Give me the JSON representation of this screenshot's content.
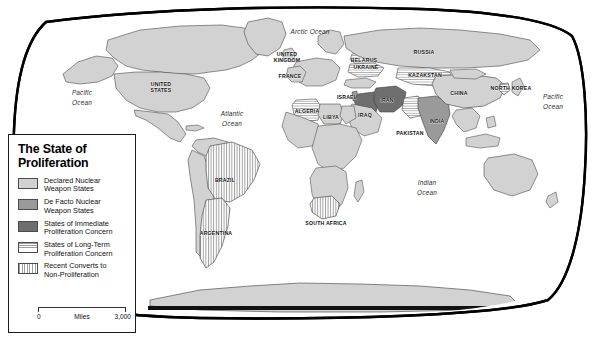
{
  "map": {
    "title": "The State of Proliferation",
    "projection": "robinson",
    "frame_color": "#000000",
    "background_color": "#ffffff",
    "ocean_labels": [
      {
        "name": "pacific-ocean-west",
        "lines": [
          "Pacific",
          "Ocean"
        ],
        "x": 82,
        "y": 97
      },
      {
        "name": "atlantic-ocean",
        "lines": [
          "Atlantic",
          "Ocean"
        ],
        "x": 232,
        "y": 118
      },
      {
        "name": "arctic-ocean",
        "lines": [
          "Arctic Ocean"
        ],
        "x": 310,
        "y": 32
      },
      {
        "name": "indian-ocean",
        "lines": [
          "Indian",
          "Ocean"
        ],
        "x": 427,
        "y": 187
      },
      {
        "name": "pacific-ocean-east",
        "lines": [
          "Pacific",
          "Ocean"
        ],
        "x": 553,
        "y": 101
      }
    ],
    "country_labels": [
      {
        "name": "united-states",
        "lines": [
          "UNITED",
          "STATES"
        ],
        "x": 161,
        "y": 87
      },
      {
        "name": "united-kingdom",
        "lines": [
          "UNITED",
          "KINGDOM"
        ],
        "x": 287,
        "y": 57
      },
      {
        "name": "france",
        "lines": [
          "FRANCE"
        ],
        "x": 290,
        "y": 76
      },
      {
        "name": "algeria",
        "lines": [
          "ALGERIA"
        ],
        "x": 307,
        "y": 111
      },
      {
        "name": "libya",
        "lines": [
          "LIBYA"
        ],
        "x": 331,
        "y": 117
      },
      {
        "name": "israel",
        "lines": [
          "ISRAEL"
        ],
        "x": 347,
        "y": 97
      },
      {
        "name": "iraq",
        "lines": [
          "IRAQ"
        ],
        "x": 365,
        "y": 115
      },
      {
        "name": "iran",
        "lines": [
          "IRAN"
        ],
        "x": 387,
        "y": 100
      },
      {
        "name": "belarus",
        "lines": [
          "BELARUS"
        ],
        "x": 364,
        "y": 60
      },
      {
        "name": "ukraine",
        "lines": [
          "UKRAINE"
        ],
        "x": 366,
        "y": 67
      },
      {
        "name": "russia",
        "lines": [
          "RUSSIA"
        ],
        "x": 424,
        "y": 52
      },
      {
        "name": "kazakstan",
        "lines": [
          "KAZAKSTAN"
        ],
        "x": 425,
        "y": 75
      },
      {
        "name": "china",
        "lines": [
          "CHINA"
        ],
        "x": 459,
        "y": 93
      },
      {
        "name": "north-korea",
        "lines": [
          "NORTH KOREA"
        ],
        "x": 511,
        "y": 88
      },
      {
        "name": "pakistan",
        "lines": [
          "PAKISTAN"
        ],
        "x": 410,
        "y": 133
      },
      {
        "name": "india",
        "lines": [
          "INDIA"
        ],
        "x": 437,
        "y": 121
      },
      {
        "name": "brazil",
        "lines": [
          "BRAZIL"
        ],
        "x": 225,
        "y": 180
      },
      {
        "name": "argentina",
        "lines": [
          "ARGENTINA"
        ],
        "x": 216,
        "y": 233
      },
      {
        "name": "south-africa",
        "lines": [
          "SOUTH AFRICA"
        ],
        "x": 326,
        "y": 223
      }
    ]
  },
  "legend": {
    "title_lines": [
      "The State of",
      "Proliferation"
    ],
    "items": [
      {
        "key": "declared",
        "swatch": "sw-declared",
        "color": "#d2d2d2",
        "lines": [
          "Declared Nuclear",
          "Weapon States"
        ]
      },
      {
        "key": "de-facto",
        "swatch": "sw-defacto",
        "color": "#9a9a9a",
        "lines": [
          "De Facto Nuclear",
          "Weapon States"
        ]
      },
      {
        "key": "immediate-concern",
        "swatch": "sw-immediate",
        "color": "#6e6e6e",
        "lines": [
          "States of Immediate",
          "Proliferation Concern"
        ]
      },
      {
        "key": "long-term-concern",
        "swatch": "sw-longterm",
        "color": "#9d9d9d",
        "lines": [
          "States of Long-Term",
          "Proliferation Concern"
        ]
      },
      {
        "key": "recent-converts",
        "swatch": "sw-converts",
        "color": "#9d9d9d",
        "lines": [
          "Recent Converts to",
          "Non-Proliferation"
        ]
      }
    ],
    "scale": {
      "min": "0",
      "unit": "Miles",
      "max": "3,000"
    }
  }
}
